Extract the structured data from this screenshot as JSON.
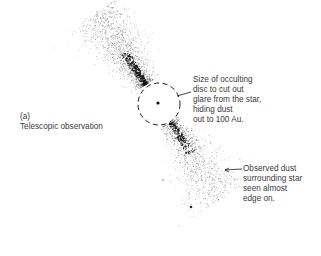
{
  "figure": {
    "panel_label": "(a)",
    "panel_title": "Telescopic observation",
    "annotations": {
      "occulting_disc": {
        "lines": [
          "Size of occulting",
          "disc to cut out",
          "glare from the star,",
          "hiding dust",
          "out to 100 Au."
        ]
      },
      "observed_dust": {
        "lines": [
          "Observed dust",
          "surrounding star",
          "seen almost",
          "edge on."
        ]
      }
    },
    "elements": {
      "star": "central-star-dot",
      "occulting_disc": "dashed-circle",
      "dust_disk": "edge-on-dust-disk",
      "pointer_disc": "line-pointer",
      "pointer_dust": "arrow-pointer"
    },
    "colors": {
      "background": "#ffffff",
      "ink": "#1a1a1a",
      "text": "#3a3a3a"
    }
  }
}
